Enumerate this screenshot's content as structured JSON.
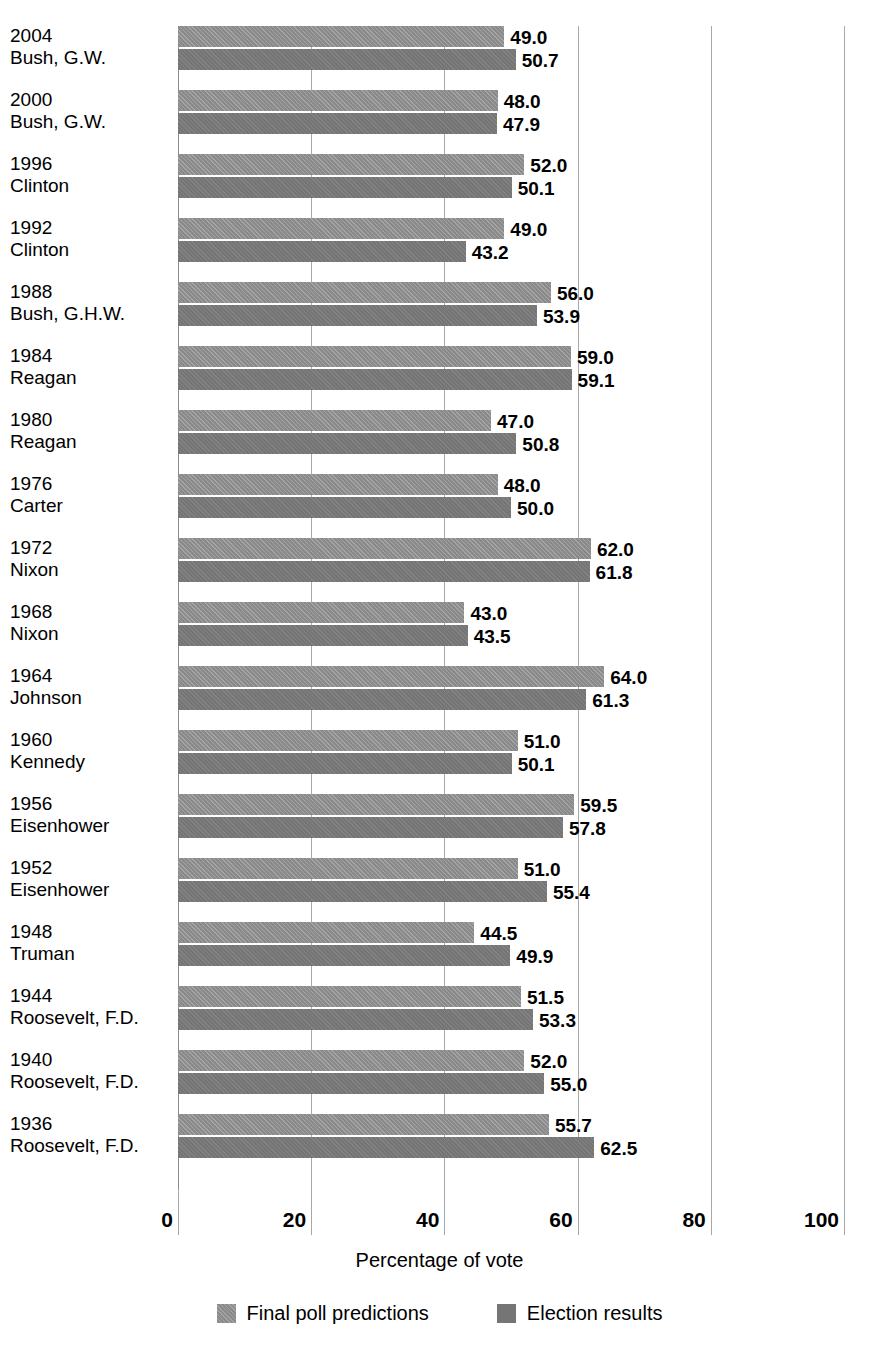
{
  "chart_data": {
    "type": "bar",
    "orientation": "horizontal",
    "title": "",
    "xlabel": "Percentage of vote",
    "ylabel": "",
    "xlim": [
      0,
      100
    ],
    "xticks": [
      0,
      20,
      40,
      60,
      80,
      100
    ],
    "grid": true,
    "legend_position": "bottom",
    "categories": [
      "2004 Bush, G.W.",
      "2000 Bush, G.W.",
      "1996 Clinton",
      "1992 Clinton",
      "1988 Bush, G.H.W.",
      "1984 Reagan",
      "1980 Reagan",
      "1976 Carter",
      "1972 Nixon",
      "1968 Nixon",
      "1964 Johnson",
      "1960 Kennedy",
      "1956 Eisenhower",
      "1952 Eisenhower",
      "1948 Truman",
      "1944 Roosevelt, F.D.",
      "1940 Roosevelt, F.D.",
      "1936 Roosevelt, F.D."
    ],
    "series": [
      {
        "name": "Final poll predictions",
        "color": "#8a8a8a",
        "values": [
          49.0,
          48.0,
          52.0,
          49.0,
          56.0,
          59.0,
          47.0,
          48.0,
          62.0,
          43.0,
          64.0,
          51.0,
          59.5,
          51.0,
          44.5,
          51.5,
          52.0,
          55.7
        ]
      },
      {
        "name": "Election results",
        "color": "#757575",
        "values": [
          50.7,
          47.9,
          50.1,
          43.2,
          53.9,
          59.1,
          50.8,
          50.0,
          61.8,
          43.5,
          61.3,
          50.1,
          57.8,
          55.4,
          49.9,
          53.3,
          55.0,
          62.5
        ]
      }
    ]
  },
  "axis": {
    "x_title": "Percentage of vote",
    "tick_labels": [
      "0",
      "20",
      "40",
      "60",
      "80",
      "100"
    ],
    "tick_values": [
      0,
      20,
      40,
      60,
      80,
      100
    ]
  },
  "legend": {
    "items": [
      {
        "label": "Final poll predictions",
        "swatch": "predicted"
      },
      {
        "label": "Election results",
        "swatch": "result"
      }
    ]
  },
  "groups": [
    {
      "year": "2004",
      "candidate": "Bush, G.W.",
      "predicted": 49.0,
      "result": 50.7,
      "predicted_label": "49.0",
      "result_label": "50.7"
    },
    {
      "year": "2000",
      "candidate": "Bush, G.W.",
      "predicted": 48.0,
      "result": 47.9,
      "predicted_label": "48.0",
      "result_label": "47.9"
    },
    {
      "year": "1996",
      "candidate": "Clinton",
      "predicted": 52.0,
      "result": 50.1,
      "predicted_label": "52.0",
      "result_label": "50.1"
    },
    {
      "year": "1992",
      "candidate": "Clinton",
      "predicted": 49.0,
      "result": 43.2,
      "predicted_label": "49.0",
      "result_label": "43.2"
    },
    {
      "year": "1988",
      "candidate": "Bush, G.H.W.",
      "predicted": 56.0,
      "result": 53.9,
      "predicted_label": "56.0",
      "result_label": "53.9"
    },
    {
      "year": "1984",
      "candidate": "Reagan",
      "predicted": 59.0,
      "result": 59.1,
      "predicted_label": "59.0",
      "result_label": "59.1"
    },
    {
      "year": "1980",
      "candidate": "Reagan",
      "predicted": 47.0,
      "result": 50.8,
      "predicted_label": "47.0",
      "result_label": "50.8"
    },
    {
      "year": "1976",
      "candidate": "Carter",
      "predicted": 48.0,
      "result": 50.0,
      "predicted_label": "48.0",
      "result_label": "50.0"
    },
    {
      "year": "1972",
      "candidate": "Nixon",
      "predicted": 62.0,
      "result": 61.8,
      "predicted_label": "62.0",
      "result_label": "61.8"
    },
    {
      "year": "1968",
      "candidate": "Nixon",
      "predicted": 43.0,
      "result": 43.5,
      "predicted_label": "43.0",
      "result_label": "43.5"
    },
    {
      "year": "1964",
      "candidate": "Johnson",
      "predicted": 64.0,
      "result": 61.3,
      "predicted_label": "64.0",
      "result_label": "61.3"
    },
    {
      "year": "1960",
      "candidate": "Kennedy",
      "predicted": 51.0,
      "result": 50.1,
      "predicted_label": "51.0",
      "result_label": "50.1"
    },
    {
      "year": "1956",
      "candidate": "Eisenhower",
      "predicted": 59.5,
      "result": 57.8,
      "predicted_label": "59.5",
      "result_label": "57.8"
    },
    {
      "year": "1952",
      "candidate": "Eisenhower",
      "predicted": 51.0,
      "result": 55.4,
      "predicted_label": "51.0",
      "result_label": "55.4"
    },
    {
      "year": "1948",
      "candidate": "Truman",
      "predicted": 44.5,
      "result": 49.9,
      "predicted_label": "44.5",
      "result_label": "49.9"
    },
    {
      "year": "1944",
      "candidate": "Roosevelt, F.D.",
      "predicted": 51.5,
      "result": 53.3,
      "predicted_label": "51.5",
      "result_label": "53.3"
    },
    {
      "year": "1940",
      "candidate": "Roosevelt, F.D.",
      "predicted": 52.0,
      "result": 55.0,
      "predicted_label": "52.0",
      "result_label": "55.0"
    },
    {
      "year": "1936",
      "candidate": "Roosevelt, F.D.",
      "predicted": 55.7,
      "result": 62.5,
      "predicted_label": "55.7",
      "result_label": "62.5"
    }
  ]
}
